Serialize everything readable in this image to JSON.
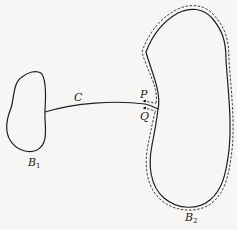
{
  "figure": {
    "labels": {
      "curve": "C",
      "point_p": "P",
      "point_q": "Q",
      "body1_main": "B",
      "body1_sub": "1",
      "body2_main": "B",
      "body2_sub": "2"
    },
    "colors": {
      "ink": "#1e1e1e",
      "paper": "#f7f6f4"
    }
  }
}
